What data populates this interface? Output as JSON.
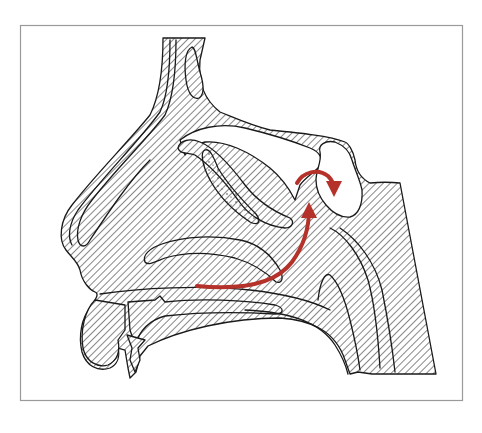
{
  "figure": {
    "type": "anatomical-illustration",
    "frame": {
      "x": 20,
      "y": 25,
      "width": 443,
      "height": 376,
      "color": "#9a9a9a"
    },
    "hatch_color": "#555555",
    "outline_color": "#1a1a1a",
    "background": "#ffffff",
    "structures": [
      "frontal-sinus",
      "nasal-bone",
      "superior-turbinate",
      "middle-turbinate",
      "inferior-turbinate",
      "sphenoid-sinus",
      "hard-palate",
      "upper-lip",
      "nasopharynx"
    ],
    "annotations": [
      {
        "kind": "airflow-arrow",
        "color": "#b5322a",
        "from": "nasal-floor",
        "to": "sphenoethmoidal-recess"
      },
      {
        "kind": "curved-arrow",
        "color": "#b5322a",
        "into": "sphenoid-sinus"
      }
    ]
  }
}
